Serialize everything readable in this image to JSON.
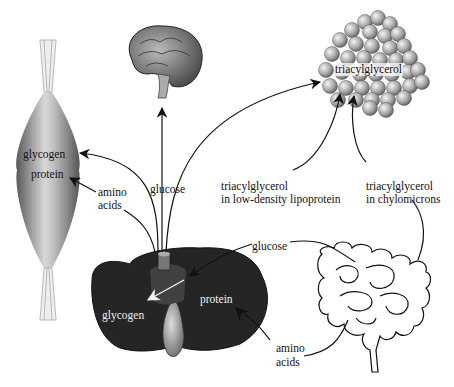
{
  "diagram": {
    "type": "metabolic-flow",
    "organs": {
      "muscle": {
        "name": "muscle",
        "labels": [
          "glycogen",
          "protein"
        ]
      },
      "brain": {
        "name": "brain"
      },
      "adipose": {
        "name": "adipose tissue",
        "label": "triacylglycerol"
      },
      "liver": {
        "name": "liver",
        "labels": [
          "glycogen",
          "protein"
        ]
      },
      "intestine": {
        "name": "intestine"
      }
    },
    "flow_labels": {
      "liver_glucose": "glucose",
      "liver_amino_line1": "amino",
      "liver_amino_line2": "acids",
      "ldl_line1": "triacylglycerol",
      "ldl_line2": "in low-density lipoprotein",
      "chylo_line1": "triacylglycerol",
      "chylo_line2": "in chylomicrons",
      "gut_glucose": "glucose",
      "gut_amino_line1": "amino",
      "gut_amino_line2": "acids"
    },
    "edges": [
      {
        "from": "liver",
        "to": "brain",
        "label": "glucose"
      },
      {
        "from": "liver",
        "to": "muscle",
        "label": "glucose",
        "target": "glycogen"
      },
      {
        "from": "liver",
        "to": "muscle",
        "label": "amino acids",
        "target": "protein"
      },
      {
        "from": "liver",
        "to": "adipose",
        "label": "triacylglycerol in low-density lipoprotein"
      },
      {
        "from": "intestine",
        "to": "adipose",
        "label": "triacylglycerol in chylomicrons"
      },
      {
        "from": "intestine",
        "to": "liver",
        "label": "glucose",
        "target": "glycogen"
      },
      {
        "from": "intestine",
        "to": "liver",
        "label": "amino acids",
        "target": "protein"
      }
    ],
    "colors": {
      "ink": "#111111",
      "liver": "#2a2a2a",
      "muscle": "#8a8a8a",
      "fat": "#b5b5b5"
    }
  }
}
